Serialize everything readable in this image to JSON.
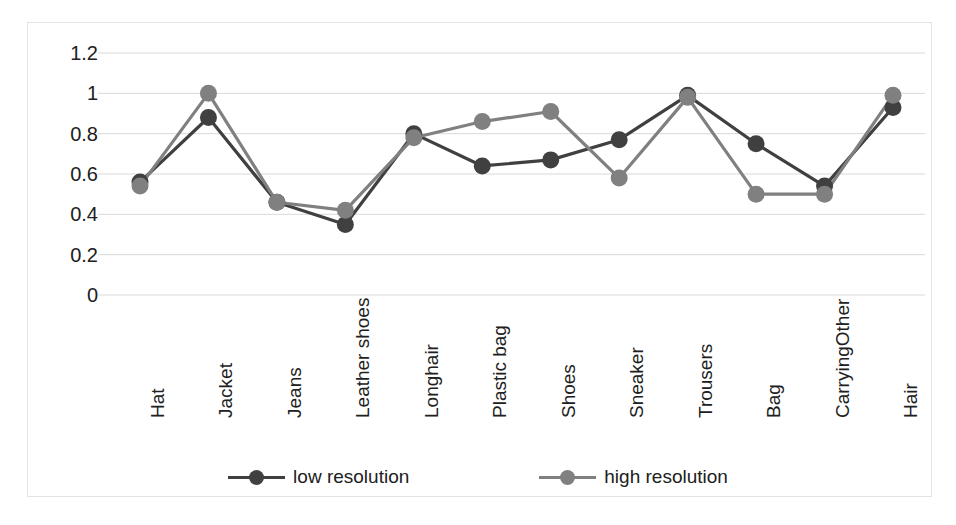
{
  "chart_data": {
    "type": "line",
    "title": "",
    "xlabel": "",
    "ylabel": "",
    "ylim": [
      0,
      1.2
    ],
    "yticks": [
      "0",
      "0.2",
      "0.4",
      "0.6",
      "0.8",
      "1",
      "1.2"
    ],
    "ytick_values": [
      0,
      0.2,
      0.4,
      0.6,
      0.8,
      1.0,
      1.2
    ],
    "grid": true,
    "legend_position": "bottom",
    "categories": [
      "Hat",
      "Jacket",
      "Jeans",
      "Leather shoes",
      "Longhair",
      "Plastic bag",
      "Shoes",
      "Sneaker",
      "Trousers",
      "Bag",
      "CarryingOther",
      "Hair"
    ],
    "series": [
      {
        "name": "low resolution",
        "color": "#404040",
        "values": [
          0.56,
          0.88,
          0.46,
          0.35,
          0.8,
          0.64,
          0.67,
          0.77,
          0.99,
          0.75,
          0.54,
          0.93
        ]
      },
      {
        "name": "high resolution",
        "color": "#808080",
        "values": [
          0.54,
          1.0,
          0.46,
          0.42,
          0.78,
          0.86,
          0.91,
          0.58,
          0.98,
          0.5,
          0.5,
          0.99
        ]
      }
    ]
  },
  "style": {
    "gridline_color": "#d9d9d9",
    "border_color": "#e3e3e3",
    "background": "#ffffff",
    "text_color": "#202020"
  },
  "legend": {
    "entries": [
      {
        "label": "low resolution",
        "color": "#404040"
      },
      {
        "label": "high resolution",
        "color": "#808080"
      }
    ]
  }
}
